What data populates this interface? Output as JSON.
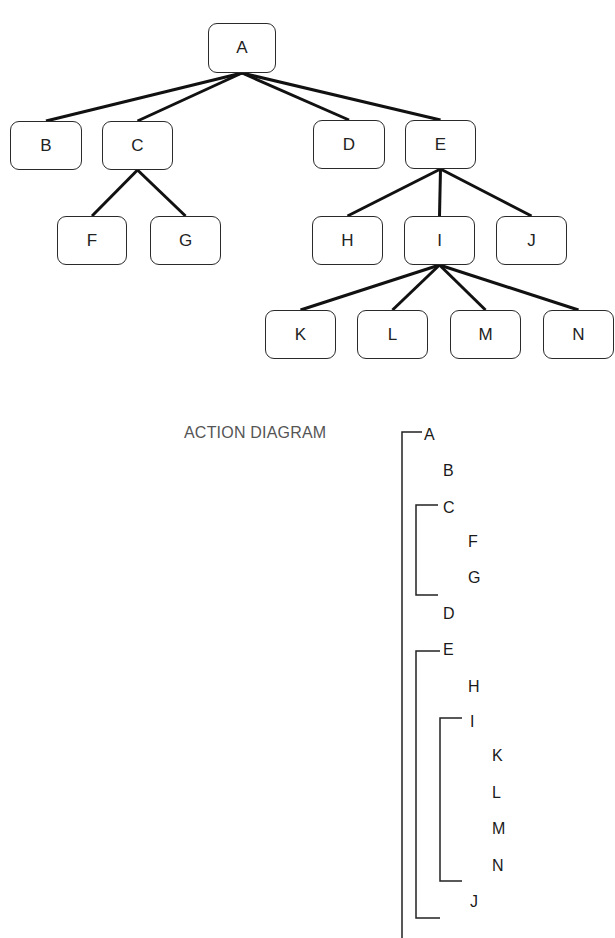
{
  "tree": {
    "nodes": [
      {
        "id": "A",
        "label": "A",
        "x": 208,
        "y": 23,
        "w": 68,
        "h": 50
      },
      {
        "id": "B",
        "label": "B",
        "x": 10,
        "y": 121,
        "w": 72,
        "h": 49
      },
      {
        "id": "C",
        "label": "C",
        "x": 102,
        "y": 121,
        "w": 71,
        "h": 49
      },
      {
        "id": "D",
        "label": "D",
        "x": 313,
        "y": 120,
        "w": 72,
        "h": 49
      },
      {
        "id": "E",
        "label": "E",
        "x": 405,
        "y": 120,
        "w": 71,
        "h": 49
      },
      {
        "id": "F",
        "label": "F",
        "x": 57,
        "y": 216,
        "w": 70,
        "h": 49
      },
      {
        "id": "G",
        "label": "G",
        "x": 150,
        "y": 216,
        "w": 71,
        "h": 49
      },
      {
        "id": "H",
        "label": "H",
        "x": 312,
        "y": 216,
        "w": 71,
        "h": 49
      },
      {
        "id": "I",
        "label": "I",
        "x": 404,
        "y": 216,
        "w": 71,
        "h": 49
      },
      {
        "id": "J",
        "label": "J",
        "x": 496,
        "y": 216,
        "w": 71,
        "h": 49
      },
      {
        "id": "K",
        "label": "K",
        "x": 265,
        "y": 310,
        "w": 71,
        "h": 49
      },
      {
        "id": "L",
        "label": "L",
        "x": 357,
        "y": 310,
        "w": 71,
        "h": 49
      },
      {
        "id": "M",
        "label": "M",
        "x": 450,
        "y": 310,
        "w": 71,
        "h": 49
      },
      {
        "id": "N",
        "label": "N",
        "x": 543,
        "y": 310,
        "w": 71,
        "h": 49
      }
    ],
    "edges": [
      [
        "A",
        "B"
      ],
      [
        "A",
        "C"
      ],
      [
        "A",
        "D"
      ],
      [
        "A",
        "E"
      ],
      [
        "C",
        "F"
      ],
      [
        "C",
        "G"
      ],
      [
        "E",
        "H"
      ],
      [
        "E",
        "I"
      ],
      [
        "E",
        "J"
      ],
      [
        "I",
        "K"
      ],
      [
        "I",
        "L"
      ],
      [
        "I",
        "M"
      ],
      [
        "I",
        "N"
      ]
    ]
  },
  "action_diagram": {
    "title": "ACTION DIAGRAM",
    "items": [
      {
        "label": "A",
        "x": 424,
        "y": 426
      },
      {
        "label": "B",
        "x": 443,
        "y": 462
      },
      {
        "label": "C",
        "x": 443,
        "y": 499
      },
      {
        "label": "F",
        "x": 468,
        "y": 533
      },
      {
        "label": "G",
        "x": 468,
        "y": 569
      },
      {
        "label": "D",
        "x": 443,
        "y": 605
      },
      {
        "label": "E",
        "x": 443,
        "y": 641
      },
      {
        "label": "H",
        "x": 468,
        "y": 678
      },
      {
        "label": "I",
        "x": 470,
        "y": 713
      },
      {
        "label": "K",
        "x": 492,
        "y": 747
      },
      {
        "label": "L",
        "x": 492,
        "y": 784
      },
      {
        "label": "M",
        "x": 492,
        "y": 820
      },
      {
        "label": "N",
        "x": 492,
        "y": 857
      },
      {
        "label": "J",
        "x": 470,
        "y": 893
      }
    ],
    "brackets": [
      {
        "name": "A",
        "x": 402,
        "top": 432,
        "bottom": 938,
        "tick": 20,
        "open_bottom": true
      },
      {
        "name": "C",
        "x": 416,
        "top": 505,
        "bottom": 595,
        "tick": 22
      },
      {
        "name": "E",
        "x": 416,
        "top": 651,
        "bottom": 918,
        "tick": 24
      },
      {
        "name": "I",
        "x": 440,
        "top": 718,
        "bottom": 881,
        "tick": 22
      }
    ]
  }
}
